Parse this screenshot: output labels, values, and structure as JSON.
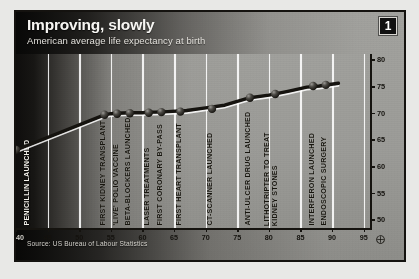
{
  "header": {
    "title": "Improving, slowly",
    "subtitle": "American average life expectancy at birth",
    "badge": "1"
  },
  "footer": {
    "source": "Source: US Bureau of Labour Statistics"
  },
  "chart_data": {
    "type": "line",
    "title": "Improving, slowly",
    "subtitle": "American average life expectancy at birth",
    "xlabel": "",
    "ylabel": "",
    "xlim": [
      1940,
      1996
    ],
    "ylim": [
      48,
      81
    ],
    "grid": "vertical",
    "legend": "none",
    "x_ticks": [
      "1940",
      "45",
      "50",
      "55",
      "60",
      "65",
      "70",
      "75",
      "80",
      "85",
      "90",
      "95"
    ],
    "x_tick_values": [
      1940,
      1945,
      1950,
      1955,
      1960,
      1965,
      1970,
      1975,
      1980,
      1985,
      1990,
      1995
    ],
    "y_ticks": [
      "80",
      "75",
      "70",
      "65",
      "60",
      "55",
      "50"
    ],
    "y_tick_values": [
      80,
      75,
      70,
      65,
      60,
      55,
      50
    ],
    "y_axis_break": true,
    "y_axis_break_symbol": "⑩",
    "series": [
      {
        "name": "American average life expectancy at birth",
        "x": [
          1940,
          1954,
          1955,
          1956,
          1958,
          1960,
          1961,
          1962,
          1964,
          1967,
          1970,
          1973,
          1977,
          1980,
          1983,
          1986,
          1988,
          1991
        ],
        "values": [
          63.0,
          69.6,
          69.8,
          69.9,
          70.0,
          70.0,
          70.1,
          70.1,
          70.2,
          70.4,
          70.9,
          71.4,
          72.8,
          73.3,
          74.0,
          74.8,
          75.0,
          75.5
        ]
      }
    ],
    "annotations": [
      {
        "label": "PENICILLIN LAUNCHED",
        "year": 1942,
        "style": "light"
      },
      {
        "label": "FIRST KIDNEY TRANSPLANT",
        "year": 1954,
        "style": "dark"
      },
      {
        "label": "'LIVE' POLIO VACCINE",
        "year": 1956,
        "style": "dark"
      },
      {
        "label": "BETA-BLOCKERS LAUNCHED",
        "year": 1958,
        "style": "dark"
      },
      {
        "label": "LASER TREATMENTS",
        "year": 1961,
        "style": "dark"
      },
      {
        "label": "FIRST CORONARY BY-PASS",
        "year": 1963,
        "style": "dark"
      },
      {
        "label": "FIRST HEART TRANSPLANT",
        "year": 1966,
        "style": "dark"
      },
      {
        "label": "CT-SCANNER LAUNCHED",
        "year": 1971,
        "style": "dark"
      },
      {
        "label": "ANTI-ULCER DRUG LAUNCHED",
        "year": 1977,
        "style": "dark"
      },
      {
        "label": "LITHOTRIPTER TO TREAT",
        "label2": "KIDNEY STONES",
        "year": 1981,
        "style": "dark"
      },
      {
        "label": "INTERFERON LAUNCHED",
        "year": 1987,
        "style": "dark"
      },
      {
        "label": "ENDOSCOPIC SURGERY",
        "year": 1989,
        "style": "dark"
      }
    ],
    "markers": [
      {
        "year": 1940,
        "value": 63.0
      },
      {
        "year": 1954,
        "value": 69.6
      },
      {
        "year": 1956,
        "value": 69.8
      },
      {
        "year": 1958,
        "value": 69.9
      },
      {
        "year": 1961,
        "value": 70.0
      },
      {
        "year": 1963,
        "value": 70.1
      },
      {
        "year": 1966,
        "value": 70.2
      },
      {
        "year": 1971,
        "value": 70.7
      },
      {
        "year": 1977,
        "value": 72.8
      },
      {
        "year": 1981,
        "value": 73.5
      },
      {
        "year": 1987,
        "value": 75.0
      },
      {
        "year": 1989,
        "value": 75.2
      }
    ],
    "line_color": "#15130f",
    "marker_color": "#3a3833",
    "background_color": "#9a9a96",
    "gridline_color": "#ffffff"
  }
}
